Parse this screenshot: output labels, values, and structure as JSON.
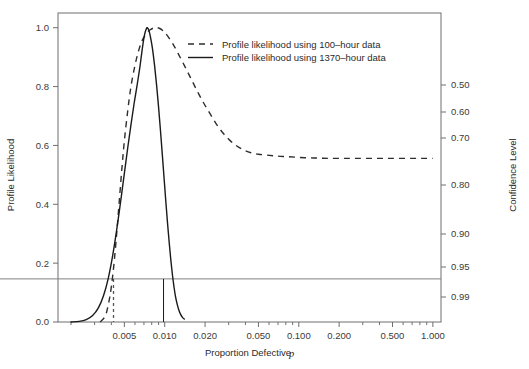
{
  "chart_data": {
    "type": "line",
    "title": "",
    "xlabel": "Proportion Defective p",
    "ylabel": "Profile Likelihood",
    "y2label": "Confidence Level",
    "xscale": "log",
    "xlim": [
      0.0016,
      1.15
    ],
    "ylim": [
      0.0,
      1.05
    ],
    "grid": false,
    "legend_position": "top-center",
    "x_ticks": [
      {
        "value": 0.005,
        "label": "0.005"
      },
      {
        "value": 0.01,
        "label": "0.010"
      },
      {
        "value": 0.02,
        "label": "0.020"
      },
      {
        "value": 0.05,
        "label": "0.050"
      },
      {
        "value": 0.1,
        "label": "0.100"
      },
      {
        "value": 0.2,
        "label": "0.200"
      },
      {
        "value": 0.5,
        "label": "0.500"
      },
      {
        "value": 1.0,
        "label": "1.000"
      }
    ],
    "x_minor_ticks": [
      0.002,
      0.003,
      0.004,
      0.006,
      0.007,
      0.008,
      0.009,
      0.03,
      0.04,
      0.06,
      0.07,
      0.08,
      0.09,
      0.3,
      0.4,
      0.6,
      0.7,
      0.8,
      0.9
    ],
    "y_ticks": [
      {
        "value": 0.0,
        "label": "0.0"
      },
      {
        "value": 0.2,
        "label": "0.2"
      },
      {
        "value": 0.4,
        "label": "0.4"
      },
      {
        "value": 0.6,
        "label": "0.6"
      },
      {
        "value": 0.8,
        "label": "0.8"
      },
      {
        "value": 1.0,
        "label": "1.0"
      }
    ],
    "y2_ticks": [
      {
        "likelihood": 0.5868,
        "label": "0.50"
      },
      {
        "likelihood": 0.5025,
        "label": "0.60"
      },
      {
        "likelihood": 0.4182,
        "label": "0.70"
      },
      {
        "likelihood": 0.2573,
        "label": "0.80"
      },
      {
        "likelihood": 0.0921,
        "label": "0.90"
      },
      {
        "likelihood": 0.1465,
        "label": "0.95"
      },
      {
        "likelihood": 0.036,
        "label": "0.99"
      }
    ],
    "y2_tick_pixel_y": [
      85,
      112,
      138,
      185,
      234,
      267,
      297
    ],
    "reference_line": {
      "y": 0.1465,
      "label": "0.95 confidence level",
      "color": "#808080"
    },
    "series": [
      {
        "name": "Profile likelihood using 100-hour data",
        "style": "dashed",
        "color": "#2e2e2e",
        "points": [
          [
            0.0033,
            0.0
          ],
          [
            0.0036,
            0.02
          ],
          [
            0.0038,
            0.06
          ],
          [
            0.004,
            0.12
          ],
          [
            0.0042,
            0.205
          ],
          [
            0.0044,
            0.31
          ],
          [
            0.0046,
            0.42
          ],
          [
            0.0048,
            0.525
          ],
          [
            0.005,
            0.615
          ],
          [
            0.0053,
            0.718
          ],
          [
            0.0056,
            0.8
          ],
          [
            0.006,
            0.872
          ],
          [
            0.0064,
            0.923
          ],
          [
            0.0068,
            0.957
          ],
          [
            0.0073,
            0.98
          ],
          [
            0.0078,
            0.993
          ],
          [
            0.0084,
            1.0
          ],
          [
            0.009,
            0.999
          ],
          [
            0.0097,
            0.99
          ],
          [
            0.0105,
            0.972
          ],
          [
            0.0115,
            0.945
          ],
          [
            0.0126,
            0.912
          ],
          [
            0.014,
            0.872
          ],
          [
            0.0155,
            0.832
          ],
          [
            0.0172,
            0.791
          ],
          [
            0.0192,
            0.75
          ],
          [
            0.0215,
            0.712
          ],
          [
            0.024,
            0.676
          ],
          [
            0.027,
            0.644
          ],
          [
            0.0305,
            0.618
          ],
          [
            0.0345,
            0.598
          ],
          [
            0.039,
            0.584
          ],
          [
            0.044,
            0.575
          ],
          [
            0.05,
            0.57
          ],
          [
            0.058,
            0.567
          ],
          [
            0.068,
            0.564
          ],
          [
            0.08,
            0.562
          ],
          [
            0.095,
            0.56
          ],
          [
            0.115,
            0.558
          ],
          [
            0.14,
            0.557
          ],
          [
            0.17,
            0.556
          ],
          [
            0.21,
            0.556
          ],
          [
            0.26,
            0.556
          ],
          [
            0.33,
            0.556
          ],
          [
            0.42,
            0.556
          ],
          [
            0.54,
            0.556
          ],
          [
            0.7,
            0.556
          ],
          [
            0.86,
            0.556
          ],
          [
            1.0,
            0.556
          ]
        ],
        "mode_estimate": 0.0084,
        "lower_confidence_bound": 0.0042,
        "asymptote": 0.556
      },
      {
        "name": "Profile likelihood using 1370-hour data",
        "style": "solid",
        "color": "#1a1a1a",
        "points": [
          [
            0.002,
            0.0
          ],
          [
            0.0023,
            0.002
          ],
          [
            0.0026,
            0.008
          ],
          [
            0.0029,
            0.022
          ],
          [
            0.0032,
            0.048
          ],
          [
            0.0035,
            0.09
          ],
          [
            0.0038,
            0.15
          ],
          [
            0.0041,
            0.228
          ],
          [
            0.0044,
            0.318
          ],
          [
            0.0047,
            0.412
          ],
          [
            0.005,
            0.505
          ],
          [
            0.0053,
            0.592
          ],
          [
            0.0056,
            0.67
          ],
          [
            0.0059,
            0.74
          ],
          [
            0.0062,
            0.8
          ],
          [
            0.0065,
            0.86
          ],
          [
            0.0067,
            0.905
          ],
          [
            0.0069,
            0.948
          ],
          [
            0.0071,
            0.98
          ],
          [
            0.0073,
            0.997
          ],
          [
            0.0074,
            1.0
          ],
          [
            0.0076,
            0.992
          ],
          [
            0.0078,
            0.972
          ],
          [
            0.0081,
            0.93
          ],
          [
            0.0084,
            0.872
          ],
          [
            0.0087,
            0.805
          ],
          [
            0.009,
            0.73
          ],
          [
            0.0093,
            0.65
          ],
          [
            0.0096,
            0.568
          ],
          [
            0.0099,
            0.487
          ],
          [
            0.0102,
            0.408
          ],
          [
            0.0105,
            0.335
          ],
          [
            0.0108,
            0.27
          ],
          [
            0.0111,
            0.212
          ],
          [
            0.0114,
            0.163
          ],
          [
            0.0117,
            0.123
          ],
          [
            0.012,
            0.09
          ],
          [
            0.0124,
            0.06
          ],
          [
            0.0128,
            0.038
          ],
          [
            0.0132,
            0.024
          ],
          [
            0.0136,
            0.015
          ],
          [
            0.014,
            0.01
          ]
        ],
        "mode_estimate": 0.0074,
        "lower_confidence_bound": 0.0059,
        "upper_confidence_bound": 0.0098
      }
    ],
    "drop_lines": [
      {
        "x": 0.00415,
        "y_top": 0.1465,
        "y_bottom": 0.0,
        "style": "dashed",
        "series": "Profile likelihood using 100-hour data"
      },
      {
        "x": 0.0098,
        "y_top": 0.1465,
        "y_bottom": 0.0,
        "style": "solid",
        "series": "Profile likelihood using 1370-hour data"
      }
    ],
    "legend": [
      {
        "label": "Profile likelihood using 100–hour data",
        "style": "dashed"
      },
      {
        "label": "Profile likelihood using 1370–hour data",
        "style": "solid"
      }
    ]
  }
}
